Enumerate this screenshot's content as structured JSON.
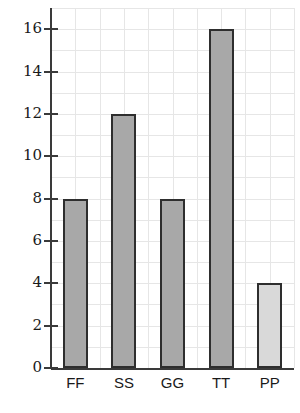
{
  "chart_data": {
    "type": "bar",
    "title": "",
    "subtitle": "",
    "xlabel": "",
    "ylabel": "",
    "categories": [
      "FF",
      "SS",
      "GG",
      "TT",
      "PP"
    ],
    "values": [
      8,
      12,
      8,
      16,
      4
    ],
    "series": [
      {
        "name": "",
        "values": [
          8,
          12,
          8,
          16,
          4
        ]
      }
    ],
    "ylim": [
      0,
      17
    ],
    "xlim": [
      0,
      5
    ],
    "ytick_labels": [
      "0",
      "2",
      "4",
      "6",
      "8",
      "10",
      "12",
      "14",
      "16"
    ],
    "ytick_values": [
      0,
      2,
      4,
      6,
      8,
      10,
      12,
      14,
      16
    ],
    "grid": true,
    "grid_axis": "both",
    "legend": false,
    "legend_position": "none",
    "annotations": [],
    "bar_colors": [
      "#a8a8a8",
      "#a8a8a8",
      "#a8a8a8",
      "#a8a8a8",
      "#d9d9d9"
    ],
    "bar_edge_color": "#2e2e2e",
    "grid_color": "#e6e6e6",
    "axis_color": "#3a3a3a",
    "background_color": "#ffffff"
  }
}
